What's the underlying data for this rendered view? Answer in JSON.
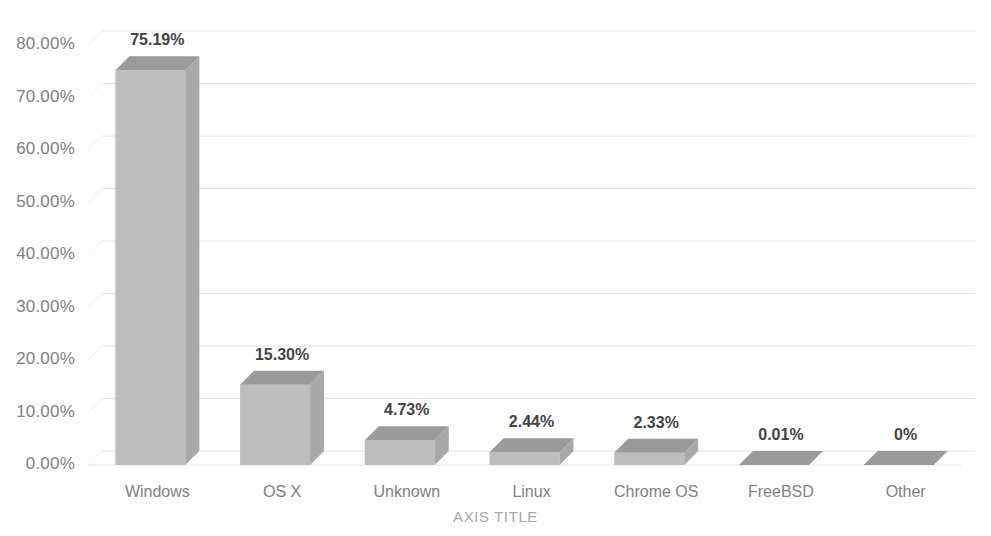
{
  "chart_data": {
    "type": "bar",
    "title": "",
    "subtitle": "",
    "xlabel": "AXIS TITLE",
    "ylabel": "",
    "categories": [
      "Windows",
      "OS X",
      "Unknown",
      "Linux",
      "Chrome OS",
      "FreeBSD",
      "Other"
    ],
    "values": [
      75.19,
      15.3,
      4.73,
      2.44,
      2.33,
      0.01,
      0
    ],
    "value_labels": [
      "75.19%",
      "15.30%",
      "4.73%",
      "2.44%",
      "2.33%",
      "0.01%",
      "0%"
    ],
    "ylim": [
      0,
      80
    ],
    "ytick_values": [
      0,
      10,
      20,
      30,
      40,
      50,
      60,
      70,
      80
    ],
    "ytick_labels": [
      "0.00%",
      "10.00%",
      "20.00%",
      "30.00%",
      "40.00%",
      "50.00%",
      "60.00%",
      "70.00%",
      "80.00%"
    ],
    "grid": true,
    "legend": false,
    "legend_position": "none",
    "style": "3d-column",
    "colors": {
      "bar_front": "#bdbdbd",
      "bar_top": "#9a9a9a",
      "bar_side": "#a8a8a8",
      "gridline": "#e2e2e2",
      "depth_line": "#ededed",
      "tick_text": "#808080",
      "data_label_text": "#434343",
      "axis_title_text": "#a6a6a6",
      "background": "#ffffff"
    }
  }
}
